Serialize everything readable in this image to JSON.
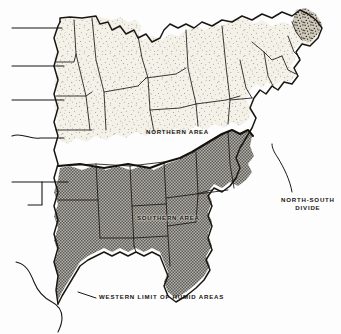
{
  "figure": {
    "type": "thematic-map",
    "region": "Eastern United States",
    "background_color": "#fdfdfd",
    "ink_color": "#1a1712"
  },
  "areas": {
    "northern": {
      "name": "NORTHERN AREA",
      "fill_style": "light random stipple",
      "fill_color": "#efeade"
    },
    "southern": {
      "name": "SOUTHERN AREA",
      "fill_style": "dark uniform halftone dot screen",
      "fill_color": "#9a9a96"
    },
    "maine": {
      "fill_style": "dense dark stipple",
      "fill_color": "#b9b4a8"
    }
  },
  "annotations": {
    "divide": {
      "line1": "NORTH-SOUTH",
      "line2": "DIVIDE"
    },
    "western_limit": "WESTERN LIMIT OF HUMID AREAS"
  },
  "leader_lines": {
    "left_edge_count": 5,
    "right_divide_count": 1,
    "bottom_count": 1
  }
}
